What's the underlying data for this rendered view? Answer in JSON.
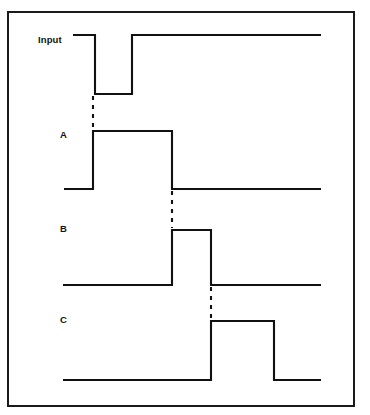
{
  "figure": {
    "background_color": "#ffffff",
    "line_color": "#111111",
    "border_color": "#1a1a1a"
  },
  "labels": {
    "input": "Input",
    "a": "A",
    "b": "B",
    "c": "C"
  },
  "chart_data": {
    "type": "line",
    "xlabel": "",
    "ylabel": "",
    "grid": false,
    "legend": "none",
    "signals": [
      {
        "name": "Input",
        "label": "Input",
        "label_pos": [
          38,
          35
        ],
        "high_y": 35,
        "low_y": 94,
        "start_x": 73,
        "end_x": 321,
        "initial_level": "high",
        "transitions": [
          {
            "x": 95,
            "edge": "falling"
          },
          {
            "x": 132,
            "edge": "rising"
          }
        ],
        "points": [
          [
            73,
            35
          ],
          [
            95,
            35
          ],
          [
            95,
            94
          ],
          [
            132,
            94
          ],
          [
            132,
            35
          ],
          [
            321,
            35
          ]
        ]
      },
      {
        "name": "A",
        "label": "A",
        "label_pos": [
          60,
          130
        ],
        "high_y": 131,
        "low_y": 189,
        "start_x": 64,
        "end_x": 321,
        "initial_level": "low",
        "transitions": [
          {
            "x": 93,
            "edge": "rising"
          },
          {
            "x": 172,
            "edge": "falling"
          }
        ],
        "points": [
          [
            64,
            189
          ],
          [
            93,
            189
          ],
          [
            93,
            131
          ],
          [
            172,
            131
          ],
          [
            172,
            189
          ],
          [
            321,
            189
          ]
        ]
      },
      {
        "name": "B",
        "label": "B",
        "label_pos": [
          60,
          224
        ],
        "high_y": 230,
        "low_y": 285,
        "start_x": 63,
        "end_x": 321,
        "initial_level": "low",
        "transitions": [
          {
            "x": 172,
            "edge": "rising"
          },
          {
            "x": 211,
            "edge": "falling"
          }
        ],
        "points": [
          [
            63,
            285
          ],
          [
            172,
            285
          ],
          [
            172,
            230
          ],
          [
            211,
            230
          ],
          [
            211,
            285
          ],
          [
            321,
            285
          ]
        ]
      },
      {
        "name": "C",
        "label": "C",
        "label_pos": [
          60,
          315
        ],
        "high_y": 321,
        "low_y": 380,
        "start_x": 63,
        "end_x": 321,
        "initial_level": "low",
        "transitions": [
          {
            "x": 211,
            "edge": "rising"
          },
          {
            "x": 274,
            "edge": "falling"
          }
        ],
        "points": [
          [
            63,
            380
          ],
          [
            211,
            380
          ],
          [
            211,
            321
          ],
          [
            274,
            321
          ],
          [
            274,
            380
          ],
          [
            321,
            380
          ]
        ]
      }
    ],
    "causality_markers": [
      {
        "from": "Input",
        "to": "A",
        "x": 93,
        "y1": 96,
        "y2": 130
      },
      {
        "from": "A",
        "to": "B",
        "x": 172,
        "y1": 191,
        "y2": 228
      },
      {
        "from": "B",
        "to": "C",
        "x": 211,
        "y1": 287,
        "y2": 319
      }
    ],
    "axis_ranges": {
      "x": [
        7,
        358
      ],
      "y": [
        11,
        410
      ]
    }
  }
}
